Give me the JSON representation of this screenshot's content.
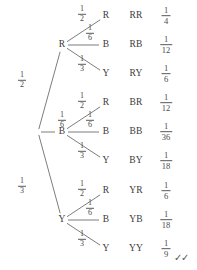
{
  "diagram": {
    "root": {
      "label": "",
      "x": 38,
      "y": 132
    },
    "colors": {
      "line": "#6e6e6e",
      "text": "#3a3a3a",
      "background": "#ffffff"
    },
    "level1": [
      {
        "node": "R",
        "x": 62,
        "y": 45,
        "prob_num": "1",
        "prob_den": "2",
        "prob_x": 22,
        "prob_y": 80
      },
      {
        "node": "B",
        "x": 62,
        "y": 132,
        "prob_num": "1",
        "prob_den": "6",
        "prob_x": 62,
        "prob_y": 120
      },
      {
        "node": "Y",
        "x": 62,
        "y": 220,
        "prob_num": "1",
        "prob_den": "3",
        "prob_x": 22,
        "prob_y": 186
      }
    ],
    "level2_branches": [
      {
        "parent": "R",
        "node": "R",
        "x": 106,
        "y": 16,
        "prob_num": "1",
        "prob_den": "2",
        "prob_x": 82,
        "prob_y": 14
      },
      {
        "parent": "R",
        "node": "B",
        "x": 106,
        "y": 45,
        "prob_num": "1",
        "prob_den": "6",
        "prob_x": 90,
        "prob_y": 33
      },
      {
        "parent": "R",
        "node": "Y",
        "x": 106,
        "y": 74,
        "prob_num": "1",
        "prob_den": "3",
        "prob_x": 82,
        "prob_y": 64
      },
      {
        "parent": "B",
        "node": "R",
        "x": 106,
        "y": 103,
        "prob_num": "1",
        "prob_den": "2",
        "prob_x": 82,
        "prob_y": 101
      },
      {
        "parent": "B",
        "node": "B",
        "x": 106,
        "y": 132,
        "prob_num": "1",
        "prob_den": "6",
        "prob_x": 90,
        "prob_y": 120
      },
      {
        "parent": "B",
        "node": "Y",
        "x": 106,
        "y": 161,
        "prob_num": "1",
        "prob_den": "3",
        "prob_x": 82,
        "prob_y": 151
      },
      {
        "parent": "Y",
        "node": "R",
        "x": 106,
        "y": 191,
        "prob_num": "1",
        "prob_den": "2",
        "prob_x": 82,
        "prob_y": 189
      },
      {
        "parent": "Y",
        "node": "B",
        "x": 106,
        "y": 220,
        "prob_num": "1",
        "prob_den": "6",
        "prob_x": 90,
        "prob_y": 208
      },
      {
        "parent": "Y",
        "node": "Y",
        "x": 106,
        "y": 249,
        "prob_num": "1",
        "prob_den": "3",
        "prob_x": 82,
        "prob_y": 239
      }
    ],
    "outcomes": [
      {
        "label": "RR",
        "x": 136,
        "y": 16,
        "prob_num": "1",
        "prob_den": "4",
        "prob_x": 166,
        "prob_y": 16
      },
      {
        "label": "RB",
        "x": 136,
        "y": 45,
        "prob_num": "1",
        "prob_den": "12",
        "prob_x": 166,
        "prob_y": 45
      },
      {
        "label": "RY",
        "x": 136,
        "y": 74,
        "prob_num": "1",
        "prob_den": "6",
        "prob_x": 166,
        "prob_y": 74
      },
      {
        "label": "BR",
        "x": 136,
        "y": 103,
        "prob_num": "1",
        "prob_den": "12",
        "prob_x": 166,
        "prob_y": 103
      },
      {
        "label": "BB",
        "x": 136,
        "y": 132,
        "prob_num": "1",
        "prob_den": "36",
        "prob_x": 166,
        "prob_y": 132
      },
      {
        "label": "BY",
        "x": 136,
        "y": 161,
        "prob_num": "1",
        "prob_den": "18",
        "prob_x": 166,
        "prob_y": 161
      },
      {
        "label": "YR",
        "x": 136,
        "y": 191,
        "prob_num": "1",
        "prob_den": "6",
        "prob_x": 166,
        "prob_y": 191
      },
      {
        "label": "YB",
        "x": 136,
        "y": 220,
        "prob_num": "1",
        "prob_den": "18",
        "prob_x": 166,
        "prob_y": 220
      },
      {
        "label": "YY",
        "x": 136,
        "y": 249,
        "prob_num": "1",
        "prob_den": "9",
        "prob_x": 166,
        "prob_y": 249
      }
    ],
    "annotation": {
      "checks": "✓✓",
      "x": 181,
      "y": 258
    }
  }
}
